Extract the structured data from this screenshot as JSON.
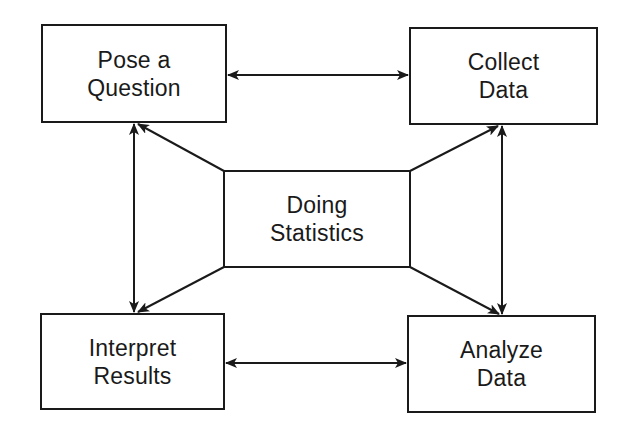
{
  "diagram": {
    "type": "flow-cycle",
    "line_color": "#1a1a1a",
    "background": "#ffffff",
    "nodes": {
      "pose": {
        "id": "pose",
        "lines": [
          "Pose a",
          "Question"
        ]
      },
      "collect": {
        "id": "collect",
        "lines": [
          "Collect",
          "Data"
        ]
      },
      "doing": {
        "id": "doing",
        "lines": [
          "Doing",
          "Statistics"
        ]
      },
      "interpret": {
        "id": "interpret",
        "lines": [
          "Interpret",
          "Results"
        ]
      },
      "analyze": {
        "id": "analyze",
        "lines": [
          "Analyze",
          "Data"
        ]
      }
    },
    "edges": [
      {
        "from": "pose",
        "to": "collect",
        "direction": "both"
      },
      {
        "from": "collect",
        "to": "analyze",
        "direction": "both"
      },
      {
        "from": "interpret",
        "to": "analyze",
        "direction": "both"
      },
      {
        "from": "pose",
        "to": "interpret",
        "direction": "both"
      },
      {
        "from": "doing",
        "to": "pose",
        "direction": "forward"
      },
      {
        "from": "doing",
        "to": "collect",
        "direction": "forward"
      },
      {
        "from": "doing",
        "to": "interpret",
        "direction": "forward"
      },
      {
        "from": "doing",
        "to": "analyze",
        "direction": "forward"
      }
    ]
  }
}
